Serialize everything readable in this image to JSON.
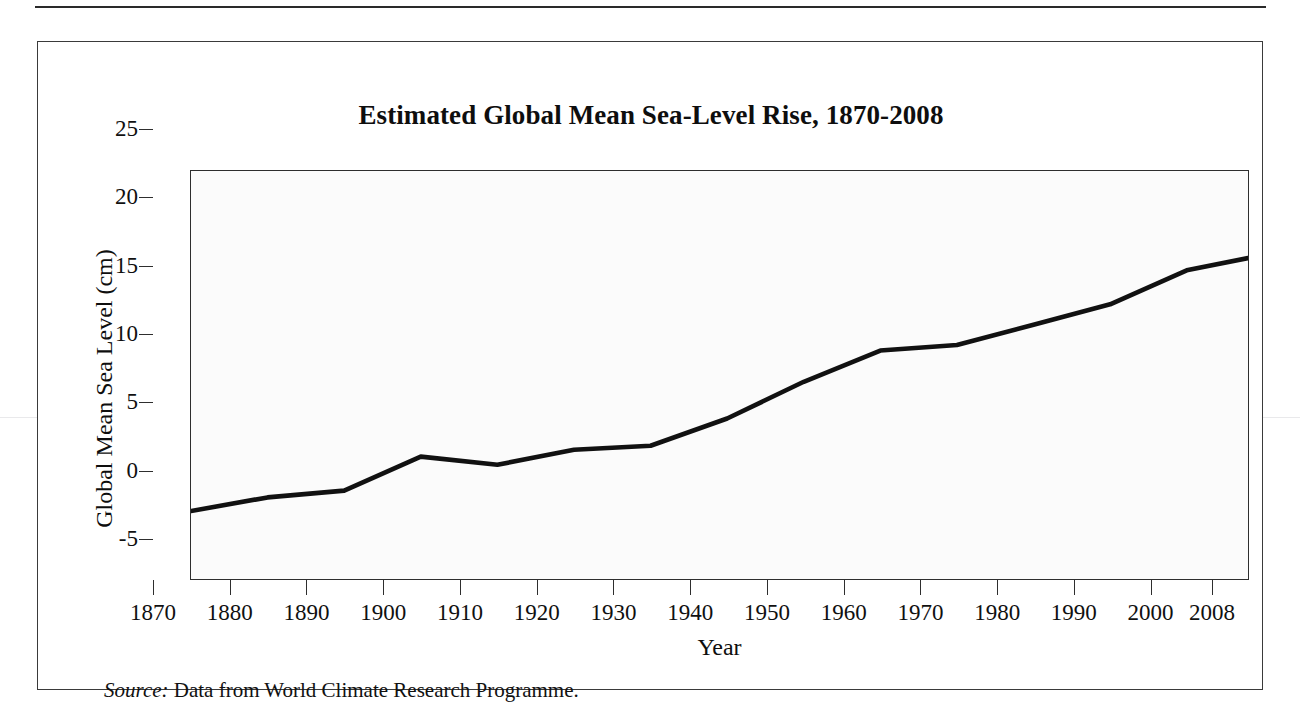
{
  "figure": {
    "title": "Estimated Global Mean Sea-Level Rise, 1870-2008",
    "source_label": "Source:",
    "source_text": " Data from World Climate Research Programme."
  },
  "chart_data": {
    "type": "line",
    "title": "Estimated Global Mean Sea-Level Rise, 1870-2008",
    "xlabel": "Year",
    "ylabel": "Global Mean Sea Level (cm)",
    "xlim": [
      1870,
      2008
    ],
    "ylim": [
      -5,
      25
    ],
    "grid": false,
    "legend": null,
    "line_color": "#111111",
    "plot_background": "#fbfbfb",
    "x_tick_labels": [
      "1870",
      "1880",
      "1890",
      "1900",
      "1910",
      "1920",
      "1930",
      "1940",
      "1950",
      "1960",
      "1970",
      "1980",
      "1990",
      "2000",
      "2008"
    ],
    "x_ticks": [
      1870,
      1880,
      1890,
      1900,
      1910,
      1920,
      1930,
      1940,
      1950,
      1960,
      1970,
      1980,
      1990,
      2000,
      2008
    ],
    "y_tick_labels": [
      "25",
      "20",
      "15",
      "10",
      "5",
      "0",
      "-5"
    ],
    "y_ticks": [
      25,
      20,
      15,
      10,
      5,
      0,
      -5
    ],
    "x": [
      1870,
      1880,
      1890,
      1900,
      1910,
      1920,
      1930,
      1940,
      1950,
      1960,
      1970,
      1980,
      1990,
      2000,
      2008
    ],
    "values": [
      0.0,
      1.0,
      1.5,
      4.0,
      3.4,
      4.5,
      4.8,
      6.8,
      9.5,
      11.8,
      12.2,
      13.7,
      15.2,
      17.7,
      18.6
    ],
    "series": [
      {
        "name": "Global mean sea level",
        "values": [
          0.0,
          1.0,
          1.5,
          4.0,
          3.4,
          4.5,
          4.8,
          6.8,
          9.5,
          11.8,
          12.2,
          13.7,
          15.2,
          17.7,
          18.6
        ]
      }
    ]
  }
}
